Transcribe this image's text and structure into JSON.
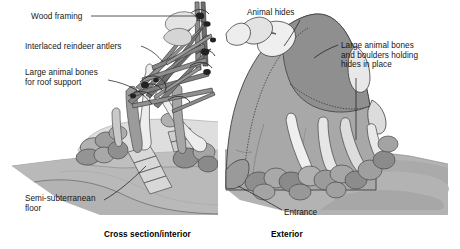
{
  "figure": {
    "kind": "archaeological-illustration",
    "panels": [
      {
        "id": "left",
        "caption": "Cross section/interior"
      },
      {
        "id": "right",
        "caption": "Exterior"
      }
    ],
    "palette": {
      "background": "#ffffff",
      "ground": "#b3b3b3",
      "ground_shadow": "#9a9a9a",
      "hide_light": "#adadad",
      "hide_dark": "#8d8d8d",
      "bone_light": "#ececec",
      "bone_mid": "#d2d2d2",
      "boulder_light": "#b8b8b8",
      "boulder_dark": "#8a8a8a",
      "timber": "#8f8f8f",
      "timber_dark": "#6b6b6b",
      "lashing": "#2b2b2b",
      "outline": "#3a3a3a",
      "leader": "#1f1f1f",
      "text": "#161616",
      "divider": "#ffffff"
    }
  },
  "labels": {
    "wood_framing": "Wood framing",
    "interlaced_antlers": "Interlaced reindeer antlers",
    "roof_support_bones": "Large animal bones\nfor roof support",
    "semi_subterranean_floor": "Semi-subterranean\nfloor",
    "animal_hides": "Animal hides",
    "bones_and_boulders": "Large animal bones\nand boulders holding\nhides in place",
    "entrance": "Entrance"
  },
  "captions": {
    "left": "Cross section/interior",
    "right": "Exterior"
  }
}
